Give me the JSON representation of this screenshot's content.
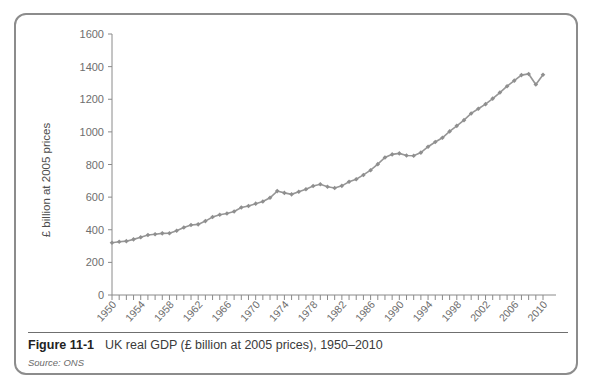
{
  "caption": {
    "figure_number": "Figure 11-1",
    "title": "UK real GDP (£ billion at 2005 prices), 1950–2010",
    "source": "Source: ONS"
  },
  "chart_data": {
    "type": "line",
    "title": "",
    "xlabel": "",
    "ylabel": "£ billion at 2005 prices",
    "ylim": [
      0,
      1600
    ],
    "ytick_values": [
      0,
      200,
      400,
      600,
      800,
      1000,
      1200,
      1400,
      1600
    ],
    "ytick_labels": [
      "0",
      "200",
      "400",
      "600",
      "800",
      "1000",
      "1200",
      "1400",
      "1600"
    ],
    "xlim": [
      1950,
      2010
    ],
    "xtick_labels": [
      "1950",
      "1954",
      "1958",
      "1962",
      "1966",
      "1970",
      "1974",
      "1978",
      "1982",
      "1986",
      "1990",
      "1994",
      "1998",
      "2002",
      "2006",
      "2010"
    ],
    "xtick_label_step": 4,
    "xtick_minor_every": 1,
    "grid": false,
    "legend": "none",
    "marker": "diamond",
    "line_color": "#969696",
    "marker_color": "#8f8f8f",
    "axis_color": "#8a8a8a",
    "x": [
      1950,
      1951,
      1952,
      1953,
      1954,
      1955,
      1956,
      1957,
      1958,
      1959,
      1960,
      1961,
      1962,
      1963,
      1964,
      1965,
      1966,
      1967,
      1968,
      1969,
      1970,
      1971,
      1972,
      1973,
      1974,
      1975,
      1976,
      1977,
      1978,
      1979,
      1980,
      1981,
      1982,
      1983,
      1984,
      1985,
      1986,
      1987,
      1988,
      1989,
      1990,
      1991,
      1992,
      1993,
      1994,
      1995,
      1996,
      1997,
      1998,
      1999,
      2000,
      2001,
      2002,
      2003,
      2004,
      2005,
      2006,
      2007,
      2008,
      2009,
      2010
    ],
    "values": [
      320,
      326,
      330,
      341,
      354,
      368,
      372,
      378,
      379,
      394,
      414,
      429,
      433,
      453,
      478,
      492,
      500,
      512,
      536,
      546,
      560,
      573,
      596,
      637,
      626,
      617,
      633,
      648,
      668,
      679,
      664,
      656,
      669,
      694,
      710,
      736,
      765,
      802,
      843,
      862,
      868,
      855,
      854,
      873,
      909,
      938,
      964,
      1003,
      1037,
      1072,
      1113,
      1142,
      1170,
      1204,
      1241,
      1280,
      1314,
      1348,
      1355,
      1290,
      1350
    ]
  }
}
